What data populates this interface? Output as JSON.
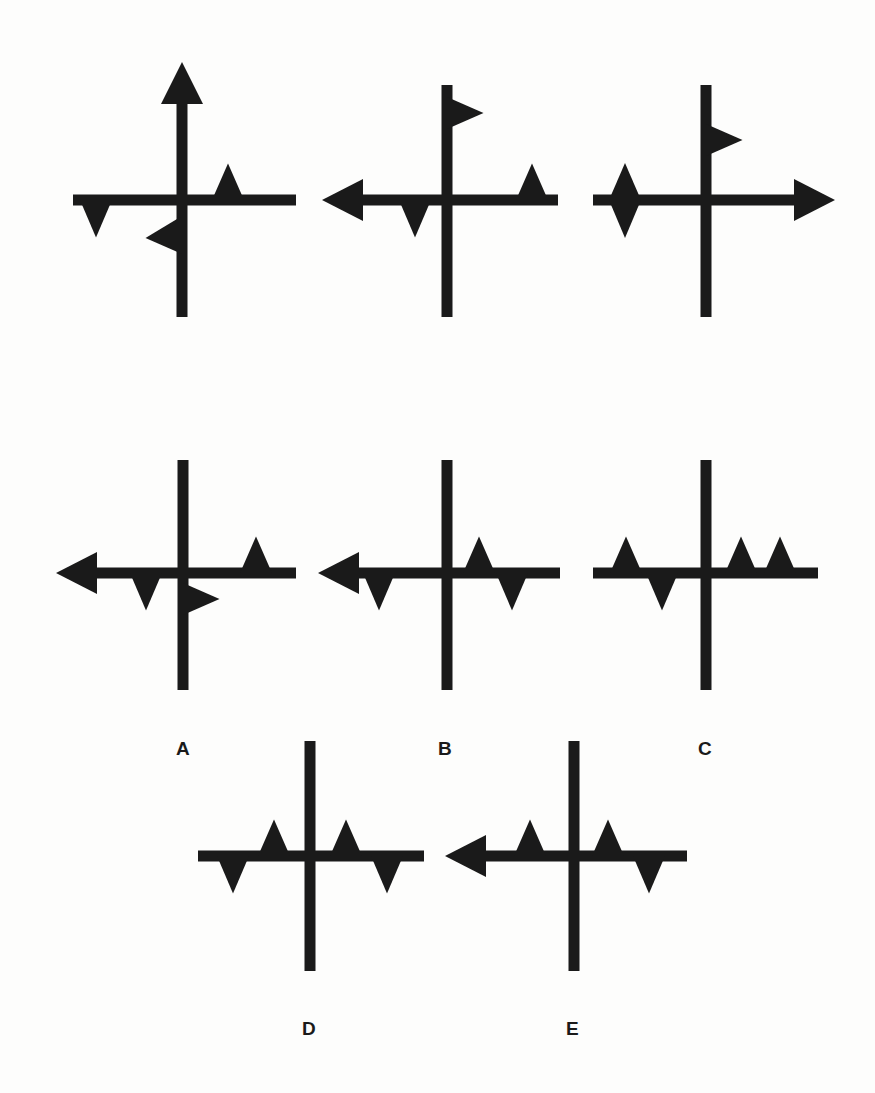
{
  "figure": {
    "ink_color": "#1a1a1a",
    "background": "#fdfdfc",
    "stimuli": [
      {
        "id": "stimulus-1",
        "cx": 182,
        "cy": 200,
        "h": [
          73,
          296
        ],
        "v": [
          100,
          317
        ],
        "arrows": [
          {
            "dir": "up",
            "tip": 62
          }
        ],
        "marks": [
          {
            "type": "tri-up",
            "x": 228,
            "base": 211
          },
          {
            "type": "tri-down",
            "x": 96,
            "base": 221
          },
          {
            "type": "flag-left",
            "y": 232
          }
        ]
      },
      {
        "id": "stimulus-2",
        "cx": 447,
        "cy": 200,
        "h": [
          322,
          558
        ],
        "v": [
          85,
          317
        ],
        "arrows": [
          {
            "dir": "left",
            "tip": 322
          }
        ],
        "marks": [
          {
            "type": "tri-up",
            "x": 532,
            "base": 211
          },
          {
            "type": "tri-down",
            "x": 415,
            "base": 221
          },
          {
            "type": "flag-right",
            "y": 113
          }
        ]
      },
      {
        "id": "stimulus-3",
        "cx": 706,
        "cy": 200,
        "h": [
          593,
          835
        ],
        "v": [
          85,
          317
        ],
        "arrows": [
          {
            "dir": "right",
            "tip": 835
          }
        ],
        "marks": [
          {
            "type": "diamond",
            "x": 625
          },
          {
            "type": "flag-right",
            "y": 140
          }
        ]
      }
    ],
    "options": [
      {
        "id": "option-a",
        "label": "A",
        "label_x": 176,
        "label_y": 738,
        "cx": 183,
        "cy": 573,
        "h": [
          56,
          296
        ],
        "v": [
          460,
          690
        ],
        "arrows": [
          {
            "dir": "left",
            "tip": 56
          }
        ],
        "marks": [
          {
            "type": "tri-up",
            "x": 256,
            "base": 584
          },
          {
            "type": "tri-down",
            "x": 146,
            "base": 594
          },
          {
            "type": "flag-right",
            "y": 599
          }
        ]
      },
      {
        "id": "option-b",
        "label": "B",
        "label_x": 438,
        "label_y": 738,
        "cx": 447,
        "cy": 573,
        "h": [
          318,
          560
        ],
        "v": [
          460,
          690
        ],
        "arrows": [
          {
            "dir": "left",
            "tip": 318
          }
        ],
        "marks": [
          {
            "type": "tri-up",
            "x": 479,
            "base": 584
          },
          {
            "type": "tri-down",
            "x": 379,
            "base": 594
          },
          {
            "type": "tri-down",
            "x": 512,
            "base": 594
          }
        ]
      },
      {
        "id": "option-c",
        "label": "C",
        "label_x": 698,
        "label_y": 738,
        "cx": 706,
        "cy": 573,
        "h": [
          593,
          818
        ],
        "v": [
          460,
          690
        ],
        "arrows": [],
        "marks": [
          {
            "type": "tri-up",
            "x": 626,
            "base": 584
          },
          {
            "type": "tri-down",
            "x": 662,
            "base": 594
          },
          {
            "type": "tri-up",
            "x": 741,
            "base": 584
          },
          {
            "type": "tri-up",
            "x": 780,
            "base": 584
          }
        ]
      },
      {
        "id": "option-d",
        "label": "D",
        "label_x": 302,
        "label_y": 1018,
        "cx": 310,
        "cy": 856,
        "h": [
          198,
          424
        ],
        "v": [
          741,
          971
        ],
        "arrows": [],
        "marks": [
          {
            "type": "tri-up",
            "x": 274,
            "base": 867
          },
          {
            "type": "tri-up",
            "x": 346,
            "base": 867
          },
          {
            "type": "tri-down",
            "x": 233,
            "base": 877
          },
          {
            "type": "tri-down",
            "x": 387,
            "base": 877
          }
        ]
      },
      {
        "id": "option-e",
        "label": "E",
        "label_x": 566,
        "label_y": 1018,
        "cx": 574,
        "cy": 856,
        "h": [
          445,
          687
        ],
        "v": [
          741,
          971
        ],
        "arrows": [
          {
            "dir": "left",
            "tip": 445
          }
        ],
        "marks": [
          {
            "type": "tri-up",
            "x": 530,
            "base": 867
          },
          {
            "type": "tri-up",
            "x": 608,
            "base": 867
          },
          {
            "type": "tri-down",
            "x": 649,
            "base": 877
          }
        ]
      }
    ]
  }
}
